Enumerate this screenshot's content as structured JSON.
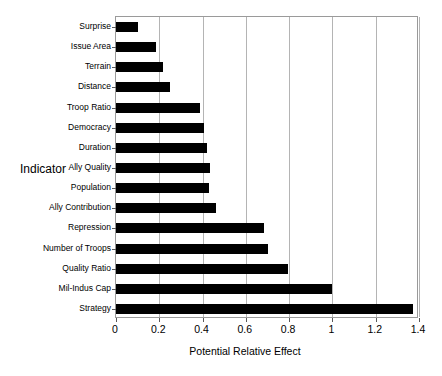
{
  "chart_data": {
    "type": "bar",
    "orientation": "horizontal",
    "title": "",
    "xlabel": "Potential Relative Effect",
    "ylabel": "Indicator",
    "xlim": [
      0,
      1.4
    ],
    "xticks": [
      "0",
      "0.2",
      "0.4",
      "0.6",
      "0.8",
      "1",
      "1.2",
      "1.4"
    ],
    "xtick_values": [
      0,
      0.2,
      0.4,
      0.6,
      0.8,
      1,
      1.2,
      1.4
    ],
    "grid": "vertical",
    "legend": "none",
    "bar_color": "#000000",
    "categories": [
      "Surprise",
      "Issue Area",
      "Terrain",
      "Distance",
      "Troop Ratio",
      "Democracy",
      "Duration",
      "Ally Quality",
      "Population",
      "Ally Contribution",
      "Repression",
      "Number of Troops",
      "Quality Ratio",
      "Mil-Indus Cap",
      "Strategy"
    ],
    "values": [
      0.1,
      0.185,
      0.215,
      0.25,
      0.39,
      0.405,
      0.42,
      0.435,
      0.43,
      0.46,
      0.685,
      0.7,
      0.795,
      1.0,
      1.37
    ]
  }
}
